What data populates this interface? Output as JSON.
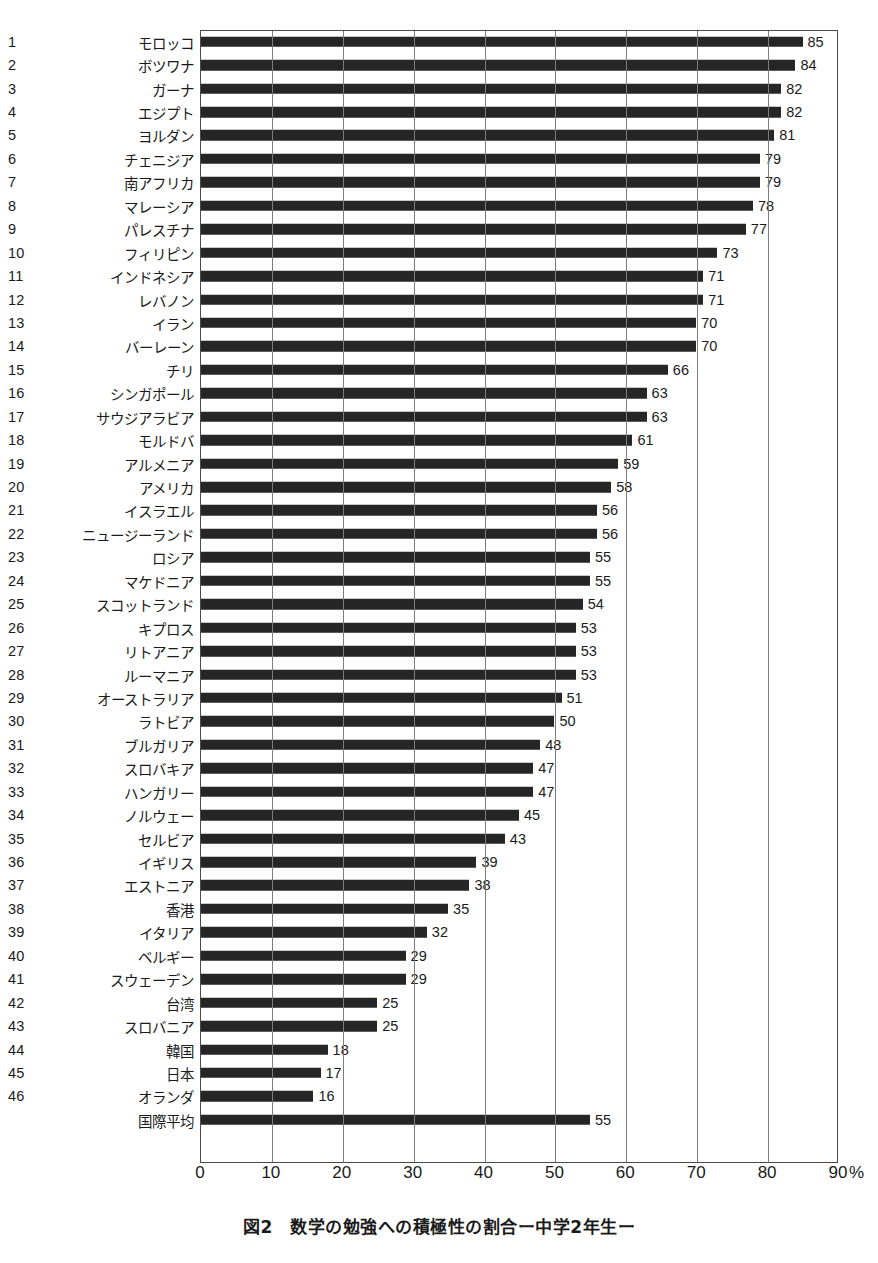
{
  "chart_data": {
    "type": "bar",
    "orientation": "horizontal",
    "title": "図2　数学の勉強への積極性の割合ー中学2年生ー",
    "xlabel": "",
    "ylabel": "",
    "unit": "%",
    "xlim": [
      0,
      90
    ],
    "xticks": [
      0,
      10,
      20,
      30,
      40,
      50,
      60,
      70,
      80,
      90
    ],
    "xtick_labels": [
      "0",
      "10",
      "20",
      "30",
      "40",
      "50",
      "60",
      "70",
      "80",
      "90"
    ],
    "grid": "vertical",
    "legend": "none",
    "bar_color": "#262626",
    "categories": [
      "モロッコ",
      "ボツワナ",
      "ガーナ",
      "エジプト",
      "ヨルダン",
      "チェニジア",
      "南アフリカ",
      "マレーシア",
      "パレスチナ",
      "フィリピン",
      "インドネシア",
      "レバノン",
      "イラン",
      "バーレーン",
      "チリ",
      "シンガポール",
      "サウジアラビア",
      "モルドバ",
      "アルメニア",
      "アメリカ",
      "イスラエル",
      "ニュージーランド",
      "ロシア",
      "マケドニア",
      "スコットランド",
      "キプロス",
      "リトアニア",
      "ルーマニア",
      "オーストラリア",
      "ラトビア",
      "ブルガリア",
      "スロバキア",
      "ハンガリー",
      "ノルウェー",
      "セルビア",
      "イギリス",
      "エストニア",
      "香港",
      "イタリア",
      "ベルギー",
      "スウェーデン",
      "台湾",
      "スロバニア",
      "韓国",
      "日本",
      "オランダ",
      "国際平均"
    ],
    "ranks": [
      "1",
      "2",
      "3",
      "4",
      "5",
      "6",
      "7",
      "8",
      "9",
      "10",
      "11",
      "12",
      "13",
      "14",
      "15",
      "16",
      "17",
      "18",
      "19",
      "20",
      "21",
      "22",
      "23",
      "24",
      "25",
      "26",
      "27",
      "28",
      "29",
      "30",
      "31",
      "32",
      "33",
      "34",
      "35",
      "36",
      "37",
      "38",
      "39",
      "40",
      "41",
      "42",
      "43",
      "44",
      "45",
      "46",
      ""
    ],
    "values": [
      85,
      84,
      82,
      82,
      81,
      79,
      79,
      78,
      77,
      73,
      71,
      71,
      70,
      70,
      66,
      63,
      63,
      61,
      59,
      58,
      56,
      56,
      55,
      55,
      54,
      53,
      53,
      53,
      51,
      50,
      48,
      47,
      47,
      45,
      43,
      39,
      38,
      35,
      32,
      29,
      29,
      25,
      25,
      18,
      17,
      16,
      55
    ]
  },
  "subcaption": ""
}
